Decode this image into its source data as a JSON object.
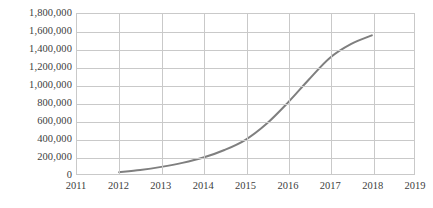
{
  "chart_data": {
    "type": "line",
    "title": "",
    "subtitle": "",
    "xlabel": "",
    "ylabel": "",
    "grid": true,
    "legend": false,
    "legend_position": "none",
    "line_color": "#7f7f7f",
    "gridline_color": "#c9c9c9",
    "axis_text_color": "#404040",
    "background_color": "#ffffff",
    "xlim": [
      2011,
      2019
    ],
    "ylim": [
      0,
      1800000
    ],
    "x_tick_labels": [
      "2011",
      "2012",
      "2013",
      "2014",
      "2015",
      "2016",
      "2017",
      "2018",
      "2019"
    ],
    "y_tick_labels": [
      "1,800,000",
      "1,600,000",
      "1,400,000",
      "1,200,000",
      "1,000,000",
      "800,000",
      "600,000",
      "400,000",
      "200,000",
      "0"
    ],
    "y_tick_values": [
      1800000,
      1600000,
      1400000,
      1200000,
      1000000,
      800000,
      600000,
      400000,
      200000,
      0
    ],
    "series": [
      {
        "name": "",
        "x": [
          2012,
          2012.5,
          2013,
          2013.5,
          2014,
          2014.5,
          2015,
          2015.5,
          2016,
          2016.5,
          2017,
          2017.5,
          2018
        ],
        "values": [
          20000,
          45000,
          80000,
          125000,
          185000,
          270000,
          385000,
          565000,
          800000,
          1060000,
          1305000,
          1460000,
          1560000
        ]
      }
    ]
  }
}
